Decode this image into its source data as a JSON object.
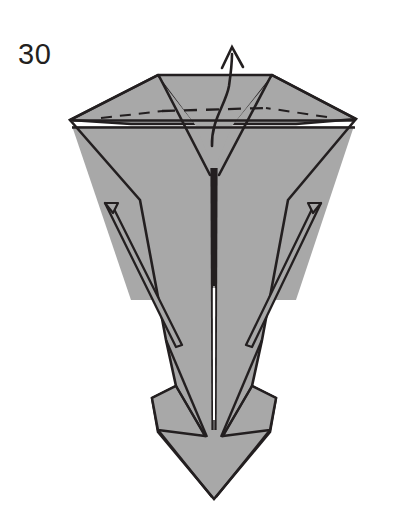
{
  "page": {
    "kind": "origami-instruction-diagram",
    "background_color": "#ffffff",
    "width": 396,
    "height": 531
  },
  "step": {
    "number": "30",
    "label_color": "#231f20"
  },
  "figure": {
    "name": "folded-paper-model",
    "paper_front_color": "#a8a8a8",
    "paper_shadow_color": "#8f8f8f",
    "paper_back_color": "#ffffff",
    "line_color": "#231f20",
    "fold_line_style": "dashed",
    "fold_line_color": "#231f20",
    "arrow_color": "#231f20",
    "arrow_meaning": "fold-up"
  },
  "annotations": {
    "valley_fold_label": "dashed fold line",
    "arrow_label": "fold the point upward"
  }
}
